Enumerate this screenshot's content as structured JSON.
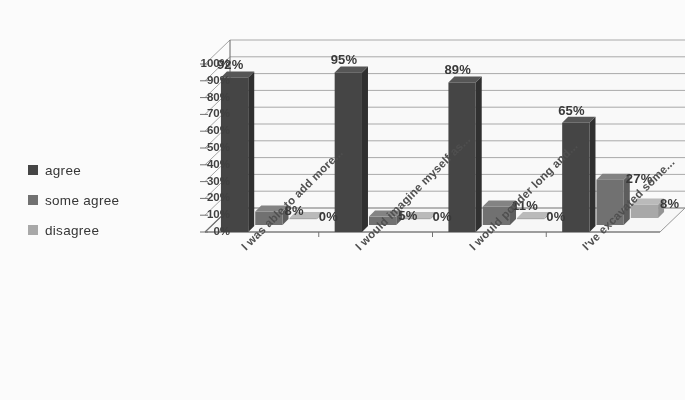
{
  "chart_data": {
    "type": "bar",
    "title": "",
    "subtitle": "",
    "xlabel": "",
    "ylabel": "",
    "ylim": [
      0,
      100
    ],
    "ytick_labels": [
      "0%",
      "10%",
      "20%",
      "30%",
      "40%",
      "50%",
      "60%",
      "70%",
      "80%",
      "90%",
      "100%"
    ],
    "ytick_values": [
      0,
      10,
      20,
      30,
      40,
      50,
      60,
      70,
      80,
      90,
      100
    ],
    "grid": true,
    "legend_position": "left",
    "three_d": true,
    "categories": [
      "I was able to add more...",
      "I would imagine myself as...",
      "I would ponder long and...",
      "I've excavated some..."
    ],
    "series": [
      {
        "name": "agree",
        "color": "#3f3f3f",
        "values": [
          92,
          95,
          89,
          65
        ],
        "labels": [
          "92%",
          "95%",
          "89%",
          "65%"
        ]
      },
      {
        "name": "some agree",
        "color": "#6e6e6e",
        "values": [
          8,
          5,
          11,
          27
        ],
        "labels": [
          "8%",
          "5%",
          "11%",
          "27%"
        ]
      },
      {
        "name": "disagree",
        "color": "#a8a8a8",
        "values": [
          0,
          0,
          0,
          8
        ],
        "labels": [
          "0%",
          "0%",
          "0%",
          "8%"
        ]
      }
    ]
  },
  "legend": {
    "items": [
      {
        "label": "agree",
        "color": "#3f3f3f"
      },
      {
        "label": "some agree",
        "color": "#6e6e6e"
      },
      {
        "label": "disagree",
        "color": "#a8a8a8"
      }
    ]
  },
  "axis": {
    "y_ticks": [
      "100%",
      "90%",
      "80%",
      "70%",
      "60%",
      "50%",
      "40%",
      "30%",
      "20%",
      "10%",
      "0%"
    ]
  }
}
